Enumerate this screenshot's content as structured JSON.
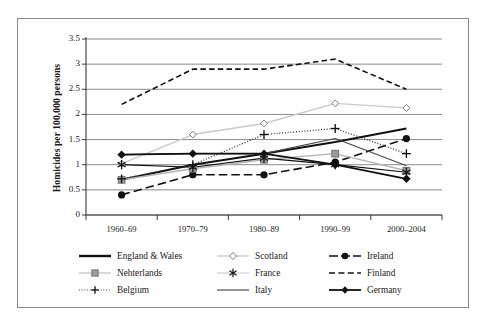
{
  "chart_data": {
    "type": "line",
    "title": "",
    "xlabel": "",
    "ylabel": "Homicides per 100,000 persons",
    "categories": [
      "1960–69",
      "1970–79",
      "1980–89",
      "1990–99",
      "2000–2004"
    ],
    "ylim": [
      0,
      3.5
    ],
    "yticks": [
      "0",
      "0.5",
      "1",
      "1.5",
      "2",
      "2.5",
      "3",
      "3.5"
    ],
    "ytick_values": [
      0,
      0.5,
      1,
      1.5,
      2,
      2.5,
      3,
      3.5
    ],
    "grid": "horizontal",
    "legend_position": "bottom",
    "series": [
      {
        "name": "England & Wales",
        "values": [
          0.7,
          1.0,
          1.22,
          1.45,
          1.72
        ],
        "color": "#111111",
        "style": "solid",
        "width": 2.0,
        "marker": "none"
      },
      {
        "name": "Scotland",
        "values": [
          1.02,
          1.6,
          1.82,
          2.22,
          2.13
        ],
        "color": "#c9c9c9",
        "style": "solid",
        "width": 1.4,
        "marker": "diamond-open"
      },
      {
        "name": "Ireland",
        "values": [
          0.4,
          0.8,
          0.8,
          1.05,
          1.52
        ],
        "color": "#111111",
        "style": "dashed-long",
        "width": 1.6,
        "marker": "circle-filled"
      },
      {
        "name": "Nehterlands",
        "values": [
          0.7,
          0.92,
          1.1,
          1.22,
          0.88
        ],
        "color": "#b4b4b4",
        "style": "solid",
        "width": 1.4,
        "marker": "square-hatched"
      },
      {
        "name": "France",
        "values": [
          1.0,
          0.95,
          1.13,
          1.0,
          0.85
        ],
        "color": "#111111",
        "style": "solid",
        "width": 1.2,
        "marker": "asterisk"
      },
      {
        "name": "Finland",
        "values": [
          2.2,
          2.9,
          2.9,
          3.1,
          2.5
        ],
        "color": "#111111",
        "style": "dashed",
        "width": 1.6,
        "marker": "none"
      },
      {
        "name": "Belgium",
        "values": [
          0.72,
          1.0,
          1.6,
          1.72,
          1.22
        ],
        "color": "#333333",
        "style": "dotted",
        "width": 1.3,
        "marker": "plus"
      },
      {
        "name": "Italy",
        "values": [
          1.2,
          1.22,
          1.22,
          1.52,
          0.98
        ],
        "color": "#444444",
        "style": "solid",
        "width": 1.1,
        "marker": "none"
      },
      {
        "name": "Germany",
        "values": [
          1.2,
          1.22,
          1.22,
          1.0,
          0.72
        ],
        "color": "#111111",
        "style": "solid",
        "width": 1.8,
        "marker": "diamond-filled"
      }
    ]
  },
  "legend": {
    "rows": [
      [
        {
          "label": "England & Wales",
          "key": "line-solid-thick-black"
        },
        {
          "label": "Scotland",
          "key": "line-gray-diamond-open"
        },
        {
          "label": "Ireland",
          "key": "line-dash-circle-filled"
        }
      ],
      [
        {
          "label": "Nehterlands",
          "key": "line-gray-square-hatched"
        },
        {
          "label": "France",
          "key": "line-gray-asterisk"
        },
        {
          "label": "Finland",
          "key": "line-dashed-black"
        }
      ],
      [
        {
          "label": "Belgium",
          "key": "line-dotted-plus"
        },
        {
          "label": "Italy",
          "key": "line-solid-thin-black"
        },
        {
          "label": "Germany",
          "key": "line-solid-diamond-filled"
        }
      ]
    ]
  },
  "axes": {
    "y_title": "Homicides per 100,000 persons"
  }
}
